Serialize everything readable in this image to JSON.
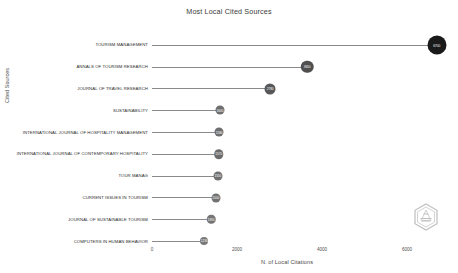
{
  "chart_data": {
    "type": "bar",
    "title": "Most Local Cited Sources",
    "xlabel": "N. of Local Citations",
    "ylabel": "Cited Sources",
    "xlim": [
      0,
      7200
    ],
    "grid": false,
    "legend": "none",
    "orientation": "horizontal-lollipop",
    "xticks": [
      {
        "value": 0,
        "label": "0"
      },
      {
        "value": 2000,
        "label": "2000"
      },
      {
        "value": 4000,
        "label": "4000"
      },
      {
        "value": 6000,
        "label": "6000"
      }
    ],
    "categories": [
      "TOURISM MANAGEMENT",
      "ANNALS OF TOURISM RESEARCH",
      "JOURNAL OF TRAVEL RESEARCH",
      "SUSTAINABILITY",
      "INTERNATIONAL JOURNAL OF HOSPITALITY MANAGEMENT",
      "INTERNATIONAL JOURNAL OF CONTEMPORARY HOSPITALITY",
      "TOUR MANAG",
      "CURRENT ISSUES IN TOURISM",
      "JOURNAL OF SUSTAINABLE TOURISM",
      "COMPUTERS IN HUMAN BEHAVIOR"
    ],
    "values": [
      6700,
      3650,
      2780,
      1600,
      1580,
      1570,
      1550,
      1500,
      1390,
      1230
    ],
    "point_labels": [
      "6700",
      "3650",
      "2780",
      "1600",
      "1580",
      "1570",
      "1550",
      "1500",
      "1390",
      "1230"
    ],
    "point_colors": [
      "#1a1a1a",
      "#4f4f4f",
      "#585858",
      "#6e6e6e",
      "#6e6e6e",
      "#6c6c6c",
      "#707070",
      "#727272",
      "#757575",
      "#787878"
    ],
    "point_sizes": [
      19,
      12.5,
      11,
      9,
      9,
      9.5,
      9,
      9,
      8.5,
      8
    ]
  },
  "watermark": {
    "name": "hexagon-logo"
  }
}
